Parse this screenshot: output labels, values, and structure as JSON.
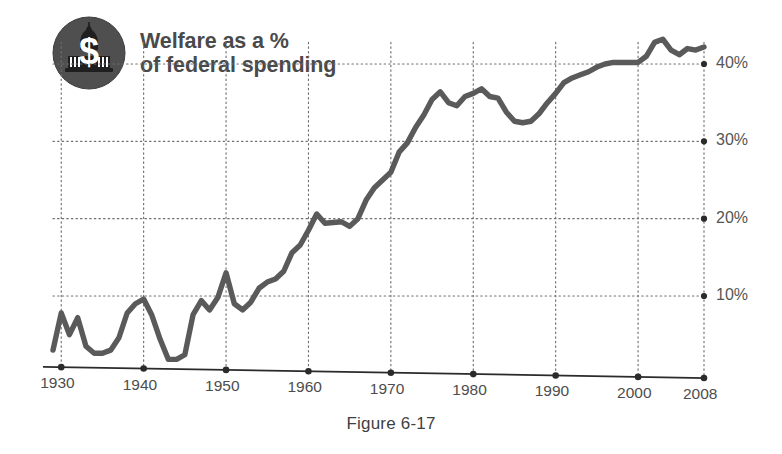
{
  "figure": {
    "caption": "Figure 6-17",
    "title_line1": "Welfare as a %",
    "title_line2": "of federal spending",
    "logo_icon": "capitol-dome-dollar-icon",
    "colors": {
      "line": "#5a5a5a",
      "axis": "#2b2b2b",
      "grid": "#6f6f6f",
      "title": "#4a4a4a",
      "tick_text": "#4d4d4d",
      "background": "#ffffff"
    }
  },
  "chart_data": {
    "type": "line",
    "title": "Welfare as a % of federal spending",
    "subtitle": "",
    "xlabel": "",
    "ylabel": "",
    "xlim": [
      1929,
      2008
    ],
    "ylim": [
      0,
      45
    ],
    "grid": true,
    "grid_axis": "both",
    "legend": "none",
    "y_ticks": [
      10,
      20,
      30,
      40
    ],
    "y_tick_labels": [
      "10%",
      "20%",
      "30%",
      "40%"
    ],
    "y_tick_side": "right",
    "x_ticks": [
      1930,
      1940,
      1950,
      1960,
      1970,
      1980,
      1990,
      2000,
      2008
    ],
    "x_tick_labels": [
      "1930",
      "1940",
      "1950",
      "1960",
      "1970",
      "1980",
      "1990",
      "2000",
      "2008"
    ],
    "series": [
      {
        "name": "Welfare share of federal spending",
        "units": "percent",
        "x": [
          1929,
          1930,
          1931,
          1932,
          1933,
          1934,
          1935,
          1936,
          1937,
          1938,
          1939,
          1940,
          1941,
          1942,
          1943,
          1944,
          1945,
          1946,
          1947,
          1948,
          1949,
          1950,
          1951,
          1952,
          1953,
          1954,
          1955,
          1956,
          1957,
          1958,
          1959,
          1960,
          1961,
          1962,
          1963,
          1964,
          1965,
          1966,
          1967,
          1968,
          1969,
          1970,
          1971,
          1972,
          1973,
          1974,
          1975,
          1976,
          1977,
          1978,
          1979,
          1980,
          1981,
          1982,
          1983,
          1984,
          1985,
          1986,
          1987,
          1988,
          1989,
          1990,
          1991,
          1992,
          1993,
          1994,
          1995,
          1996,
          1997,
          1998,
          1999,
          2000,
          2001,
          2002,
          2003,
          2004,
          2005,
          2006,
          2007,
          2008
        ],
        "y": [
          3.0,
          7.8,
          5.0,
          7.2,
          3.5,
          2.6,
          2.6,
          3.0,
          4.6,
          7.8,
          9.0,
          9.6,
          7.5,
          4.4,
          1.8,
          1.8,
          2.4,
          7.6,
          9.4,
          8.2,
          9.8,
          13.0,
          9.0,
          8.2,
          9.2,
          11.0,
          11.8,
          12.2,
          13.2,
          15.6,
          16.6,
          18.5,
          20.6,
          19.4,
          19.5,
          19.6,
          19.0,
          20.0,
          22.4,
          24.0,
          25.0,
          26.0,
          28.6,
          29.8,
          31.8,
          33.4,
          35.4,
          36.4,
          35.0,
          34.6,
          35.8,
          36.2,
          36.8,
          35.8,
          35.6,
          33.8,
          32.6,
          32.4,
          32.6,
          33.6,
          35.0,
          36.2,
          37.6,
          38.2,
          38.6,
          39.0,
          39.6,
          40.0,
          40.2,
          40.2,
          40.2,
          40.2,
          41.0,
          42.8,
          43.2,
          41.8,
          41.2,
          42.0,
          41.8,
          42.2
        ]
      }
    ]
  }
}
